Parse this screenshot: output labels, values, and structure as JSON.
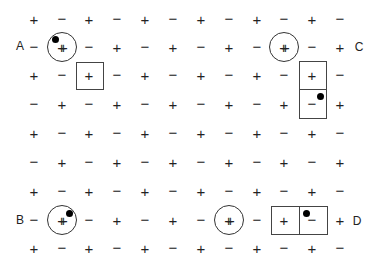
{
  "diagram": {
    "grid": {
      "columns_x": [
        34,
        62,
        89,
        117,
        145,
        173,
        201,
        229,
        257,
        284,
        312,
        340
      ],
      "rows_y": [
        19,
        47,
        75,
        104,
        133,
        162,
        191,
        220,
        248
      ],
      "rows": [
        [
          "+",
          "−",
          "+",
          "−",
          "+",
          "−",
          "+",
          "−",
          "+",
          "−",
          "+",
          "−"
        ],
        [
          "−",
          "++",
          "−",
          "+",
          "−",
          "+",
          "−",
          "+",
          "−",
          "++",
          "−",
          "+"
        ],
        [
          "+",
          "−",
          "+",
          "−",
          "+",
          "−",
          "+",
          "−",
          "+",
          "−",
          "+",
          "−"
        ],
        [
          "−",
          "+",
          "−",
          "+",
          "−",
          "+",
          "−",
          "+",
          "−",
          "+",
          "−",
          "+"
        ],
        [
          "+",
          "−",
          "+",
          "−",
          "+",
          "−",
          "+",
          "−",
          "+",
          "−",
          "+",
          "−"
        ],
        [
          "−",
          "+",
          "−",
          "+",
          "−",
          "+",
          "−",
          "+",
          "−",
          "+",
          "−",
          "+"
        ],
        [
          "+",
          "−",
          "+",
          "−",
          "+",
          "−",
          "+",
          "−",
          "+",
          "−",
          "+",
          "−"
        ],
        [
          "−",
          "++",
          "−",
          "+",
          "−",
          "+",
          "−",
          "++",
          "−",
          "+",
          "−",
          "+"
        ],
        [
          "+",
          "−",
          "+",
          "−",
          "+",
          "−",
          "+",
          "−",
          "+",
          "−",
          "+",
          "−"
        ]
      ]
    },
    "labels": [
      {
        "text": "A",
        "x": 20,
        "y": 46
      },
      {
        "text": "C",
        "x": 359,
        "y": 47
      },
      {
        "text": "B",
        "x": 20,
        "y": 220
      },
      {
        "text": "D",
        "x": 357,
        "y": 221
      }
    ],
    "circles": [
      {
        "id": "A",
        "cx": 62,
        "cy": 47,
        "dot": {
          "x": 55,
          "y": 39
        }
      },
      {
        "id": "C",
        "cx": 284,
        "cy": 47,
        "dot": null
      },
      {
        "id": "B",
        "cx": 62,
        "cy": 220,
        "dot": {
          "x": 69,
          "y": 213
        }
      },
      {
        "id": "D",
        "cx": 229,
        "cy": 220,
        "dot": null
      }
    ],
    "boxes": [
      {
        "id": "box-A",
        "x": 76,
        "y": 62,
        "w": 28,
        "h": 28,
        "dot": null
      },
      {
        "id": "box-C-upper",
        "x": 299,
        "y": 61,
        "w": 28,
        "h": 29,
        "dot": null
      },
      {
        "id": "box-C-lower",
        "x": 299,
        "y": 89,
        "w": 28,
        "h": 30,
        "dot": {
          "x": 320,
          "y": 96
        }
      },
      {
        "id": "box-D-left",
        "x": 271,
        "y": 206,
        "w": 29,
        "h": 29,
        "dot": null
      },
      {
        "id": "box-D-right",
        "x": 299,
        "y": 206,
        "w": 29,
        "h": 29,
        "dot": {
          "x": 306,
          "y": 213
        }
      }
    ],
    "legend_text": {
      "plus": "+",
      "minus": "−",
      "double_plus": "++"
    }
  }
}
